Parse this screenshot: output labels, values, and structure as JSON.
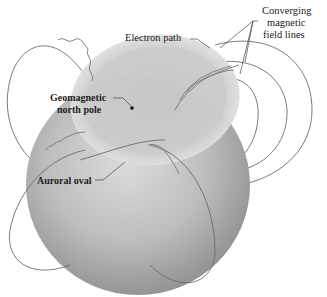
{
  "diagram": {
    "type": "earth-magnetosphere-aurora",
    "labels": {
      "electron_path": "Electron path",
      "converging_line1": "Converging",
      "converging_line2": "magnetic",
      "converging_line3": "field lines",
      "pole_line1": "Geomagnetic",
      "pole_line2": "north pole",
      "auroral_oval": "Auroral oval"
    },
    "colors": {
      "globe_light": "#d8d8d8",
      "globe_mid": "#b4b4b4",
      "globe_dark": "#8e8e8e",
      "oval_ring": "#c6c6c6",
      "field_line": "#6b6b6b",
      "text": "#222222"
    }
  }
}
